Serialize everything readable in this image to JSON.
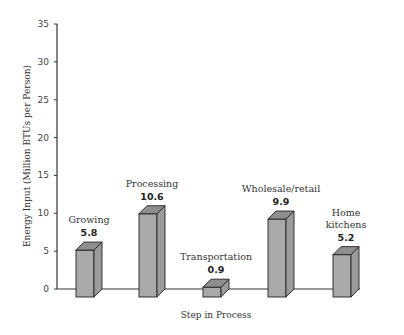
{
  "chart_data": {
    "type": "bar",
    "title": "",
    "xlabel": "Step in Process",
    "ylabel": "Energy Input (Million BTUs per Person)",
    "ylim": [
      0,
      35
    ],
    "yticks": [
      0,
      5,
      10,
      15,
      20,
      25,
      30,
      35
    ],
    "grid": false,
    "legend": null,
    "style": "3d-bar",
    "categories": [
      "Growing",
      "Processing",
      "Transportation",
      "Wholesale/retail",
      "Home kitchens"
    ],
    "category_label_lines": [
      [
        "Growing"
      ],
      [
        "Processing"
      ],
      [
        "Transportation"
      ],
      [
        "Wholesale/retail"
      ],
      [
        "Home",
        "kitchens"
      ]
    ],
    "values": [
      5.8,
      10.6,
      0.9,
      9.9,
      5.2
    ],
    "value_labels": [
      "5.8",
      "10.6",
      "0.9",
      "9.9",
      "5.2"
    ],
    "colors": {
      "bar_front": "#a9a9a9",
      "bar_top": "#8e8e8e",
      "bar_side": "#9b9b9b",
      "outline": "#222222",
      "axis": "#333333"
    }
  }
}
